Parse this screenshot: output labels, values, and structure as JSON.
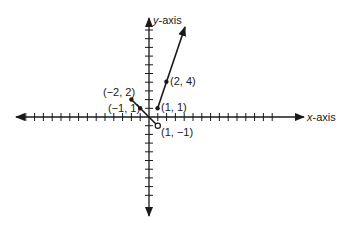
{
  "diagram": {
    "type": "coordinate-plane-graph",
    "axes": {
      "x_label_italic": "x",
      "x_label_rest": "-axis",
      "y_label_italic": "y",
      "y_label_rest": "-axis",
      "x_range": [
        -14,
        14
      ],
      "y_range": [
        -9,
        10
      ]
    },
    "segments": [
      {
        "name": "left-piece",
        "from": [
          -2,
          2
        ],
        "to": [
          1,
          -1
        ],
        "start": "closed",
        "end": "open"
      },
      {
        "name": "right-ray",
        "from": [
          1,
          1
        ],
        "direction": "arrow-up-right",
        "start": "closed",
        "through": [
          2,
          4
        ]
      }
    ],
    "points": [
      {
        "label": "(−2, 2)",
        "x": -2,
        "y": 2,
        "style": "closed"
      },
      {
        "label": "(−1, 1)",
        "x": -1,
        "y": 1,
        "style": "closed"
      },
      {
        "label": "(1, −1)",
        "x": 1,
        "y": -1,
        "style": "open"
      },
      {
        "label": "(1, 1)",
        "x": 1,
        "y": 1,
        "style": "closed"
      },
      {
        "label": "(2, 4)",
        "x": 2,
        "y": 4,
        "style": "closed"
      }
    ],
    "colors": {
      "line": "#1a1a1a",
      "background": "#ffffff"
    }
  }
}
